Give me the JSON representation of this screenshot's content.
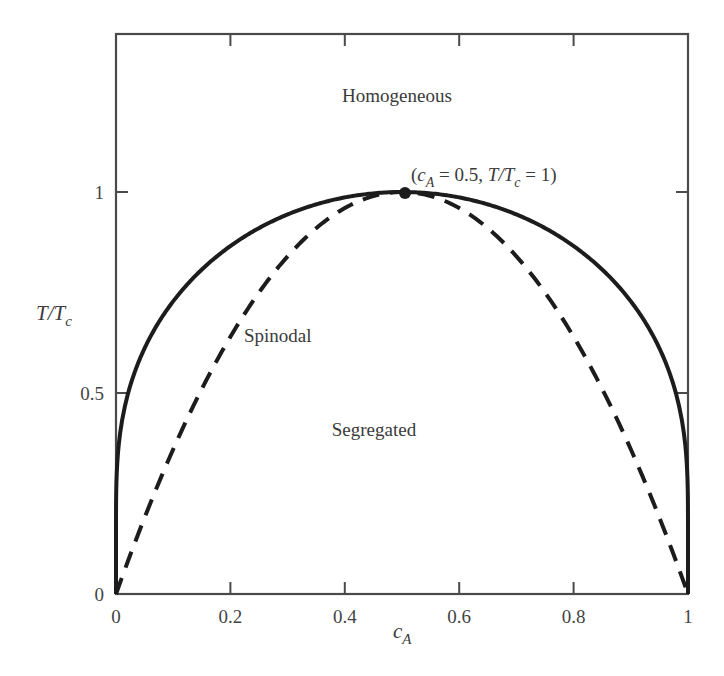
{
  "chart_data": {
    "type": "line",
    "title": "",
    "xlabel": "c_A",
    "ylabel": "T/T_c",
    "xlim": [
      0,
      1
    ],
    "ylim": [
      0,
      1.39
    ],
    "grid": false,
    "legend": null,
    "x_ticks": [
      0,
      0.2,
      0.4,
      0.6,
      0.8,
      1
    ],
    "x_tick_labels": [
      "0",
      "0.2",
      "0.4",
      "0.6",
      "0.8",
      "1"
    ],
    "y_ticks": [
      0,
      0.5,
      1
    ],
    "y_tick_labels": [
      "0",
      "0.5",
      "1"
    ],
    "series": [
      {
        "name": "Binodal (coexistence curve)",
        "style": "solid",
        "formula": "T/Tc = 2(1-2c)/ln((1-c)/c)",
        "x": [
          0.0,
          0.005,
          0.02,
          0.05,
          0.1,
          0.2,
          0.3,
          0.4,
          0.5,
          0.6,
          0.7,
          0.8,
          0.9,
          0.95,
          0.98,
          0.995,
          1.0
        ],
        "values": [
          0.0,
          0.19,
          0.49,
          0.61,
          0.73,
          0.87,
          0.94,
          0.99,
          1.0,
          0.99,
          0.94,
          0.87,
          0.73,
          0.61,
          0.49,
          0.19,
          0.0
        ]
      },
      {
        "name": "Spinodal",
        "style": "dashed",
        "formula": "T/Tc = 4c(1-c)",
        "x": [
          0.0,
          0.1,
          0.2,
          0.3,
          0.4,
          0.5,
          0.6,
          0.7,
          0.8,
          0.9,
          1.0
        ],
        "values": [
          0.0,
          0.36,
          0.64,
          0.84,
          0.96,
          1.0,
          0.96,
          0.84,
          0.64,
          0.36,
          0.0
        ]
      }
    ],
    "critical_point": {
      "x": 0.5,
      "y": 1.0
    },
    "annotations": [
      {
        "text": "Homogeneous",
        "x": 0.49,
        "y": 1.24
      },
      {
        "text": "Spinodal",
        "x": 0.3,
        "y": 0.66
      },
      {
        "text": "Segregated",
        "x": 0.5,
        "y": 0.4
      },
      {
        "text": "(c_A = 0.5, T/T_c = 1)",
        "x": 0.73,
        "y": 1.05
      }
    ]
  },
  "labels": {
    "homogeneous": "Homogeneous",
    "spinodal": "Spinodal",
    "segregated": "Segregated",
    "critical_open": "(",
    "critical_c": "c",
    "critical_c_sub": "A",
    "critical_eq1": " = 0.5, ",
    "critical_T": "T",
    "critical_slash": "/",
    "critical_Tc": "T",
    "critical_Tc_sub": "c",
    "critical_eq2": " = 1)",
    "xlabel_main": "c",
    "xlabel_sub": "A",
    "ylabel_T": "T",
    "ylabel_slash": "/",
    "ylabel_Tc": "T",
    "ylabel_sub": "c"
  },
  "colors": {
    "line": "#1c1c1c",
    "frame": "#4a4a4a",
    "text": "#3a3a3a"
  }
}
